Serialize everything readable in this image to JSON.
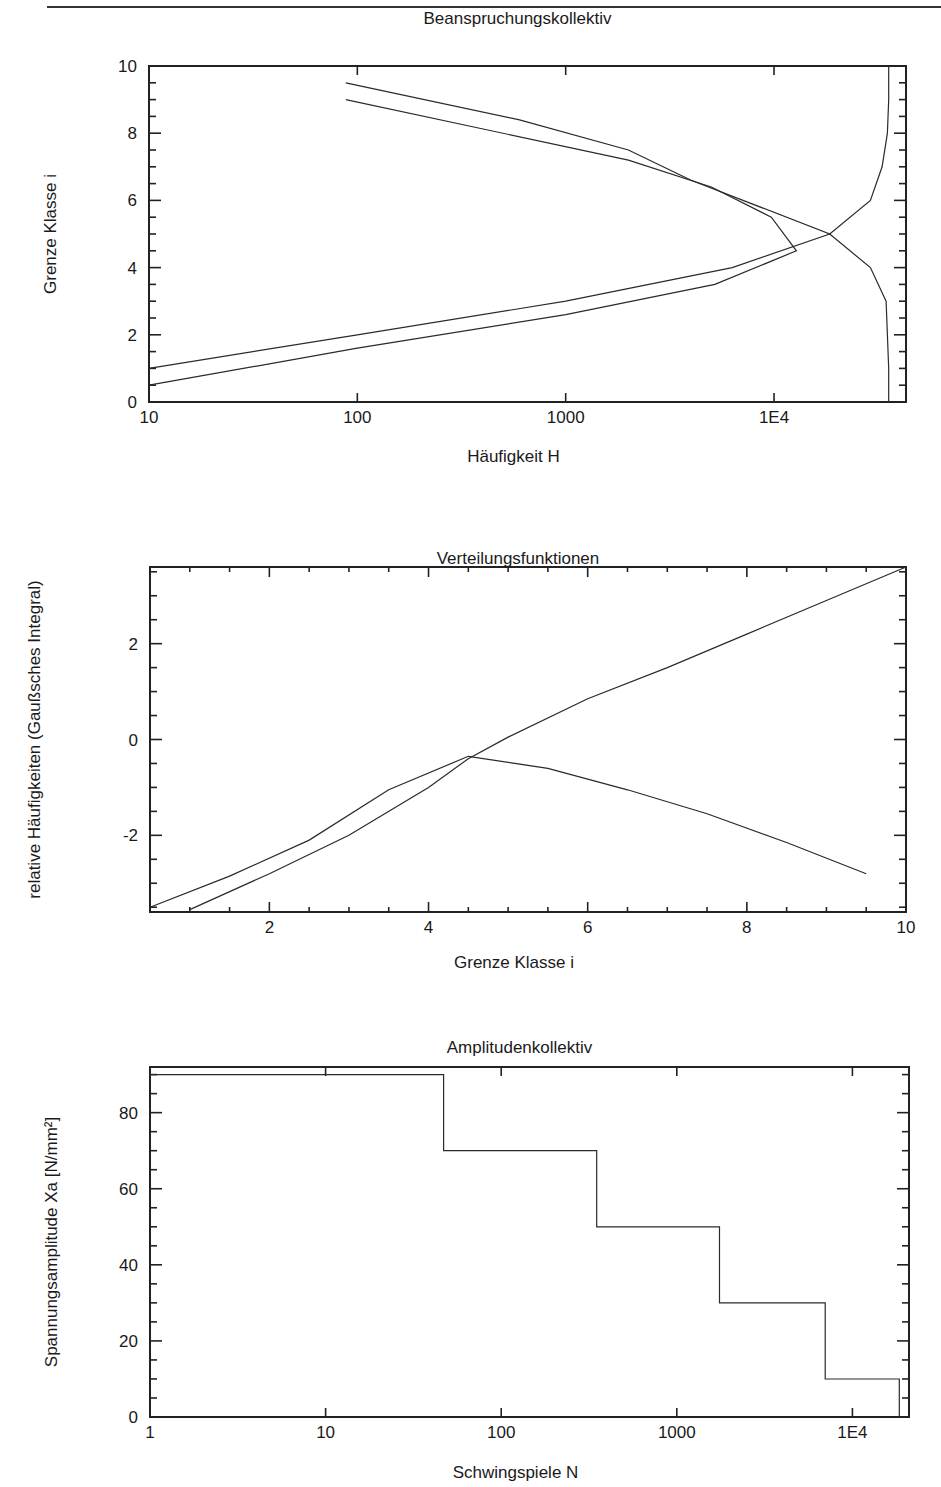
{
  "page": {
    "header_text": "... p ... g ..."
  },
  "chart_data": [
    {
      "id": "beanspruchung",
      "type": "line",
      "title": "Beanspruchungskollektiv",
      "xlabel": "Häufigkeit H",
      "ylabel": "Grenze Klasse i",
      "xscale": "log",
      "xlim": [
        10,
        43000
      ],
      "ylim": [
        0,
        10
      ],
      "xticks": [
        10,
        100,
        1000,
        10000
      ],
      "xtick_labels": [
        "10",
        "100",
        "1000",
        "1E4"
      ],
      "yticks": [
        0,
        2,
        4,
        6,
        8,
        10
      ],
      "ytick_labels": [
        "0",
        "2",
        "4",
        "6",
        "8",
        "10"
      ],
      "grid": false,
      "legend": null,
      "series": [
        {
          "name": "Kollektiv (Klassengrenzen)",
          "x": [
            10,
            100,
            1000,
            6300,
            18500,
            4000,
            2000,
            600,
            88
          ],
          "y": [
            1.0,
            2.0,
            3.0,
            4.0,
            5.0,
            6.6,
            7.5,
            8.4,
            9.5
          ]
        },
        {
          "name": "Kollektiv (Klassenmitten)",
          "x": [
            10,
            100,
            1000,
            5200,
            12800,
            9700,
            5000,
            2000,
            88
          ],
          "y": [
            0.5,
            1.6,
            2.6,
            3.5,
            4.5,
            5.5,
            6.4,
            7.2,
            9.0
          ]
        },
        {
          "name": "Summenhäufigkeit",
          "x": [
            35500,
            35500,
            34500,
            29000,
            18500,
            29000,
            33000,
            35000,
            35500,
            35500
          ],
          "y": [
            0,
            1,
            3.0,
            4.0,
            5.0,
            6.0,
            7.0,
            8.0,
            9.0,
            10.0
          ]
        }
      ]
    },
    {
      "id": "verteilung",
      "type": "line",
      "title": "Verteilungsfunktionen",
      "xlabel": "Grenze Klasse i",
      "ylabel": "relative Häufigkeiten (Gaußsches Integral)",
      "xscale": "linear",
      "xlim": [
        0.5,
        10
      ],
      "ylim": [
        -3.6,
        3.6
      ],
      "xticks": [
        2,
        4,
        6,
        8,
        10
      ],
      "xtick_labels": [
        "2",
        "4",
        "6",
        "8",
        "10"
      ],
      "yticks": [
        -2,
        0,
        2
      ],
      "ytick_labels": [
        "-2",
        "0",
        "2"
      ],
      "grid": false,
      "legend": null,
      "series": [
        {
          "name": "Verteilung A",
          "x": [
            0.5,
            1.5,
            2.5,
            3.5,
            4.5,
            5.5,
            6.5,
            7.5,
            8.5,
            9.5
          ],
          "y": [
            -3.5,
            -2.85,
            -2.1,
            -1.05,
            -0.35,
            -0.6,
            -1.05,
            -1.55,
            -2.15,
            -2.8
          ]
        },
        {
          "name": "Verteilung B",
          "x": [
            1,
            2,
            3,
            4,
            4.5,
            5,
            6,
            7,
            8,
            9,
            10
          ],
          "y": [
            -3.55,
            -2.8,
            -2.0,
            -1.0,
            -0.4,
            0.05,
            0.85,
            1.5,
            2.2,
            2.9,
            3.6
          ]
        }
      ]
    },
    {
      "id": "amplitude",
      "type": "line",
      "title": "Amplitudenkollektiv",
      "xlabel": "Schwingspiele N",
      "ylabel": "Spannungsamplitude Xa [N/mm²]",
      "xscale": "log",
      "xlim": [
        1,
        21000
      ],
      "ylim": [
        0,
        92
      ],
      "xticks": [
        1,
        10,
        100,
        1000,
        10000
      ],
      "xtick_labels": [
        "1",
        "10",
        "100",
        "1000",
        "1E4"
      ],
      "yticks": [
        0,
        20,
        40,
        60,
        80
      ],
      "ytick_labels": [
        "0",
        "20",
        "40",
        "60",
        "80"
      ],
      "grid": false,
      "legend": null,
      "series": [
        {
          "name": "Amplitudenkollektiv (Treppe)",
          "step": true,
          "x": [
            1,
            47,
            47,
            350,
            350,
            1750,
            1750,
            7000,
            7000,
            18500,
            18500
          ],
          "y": [
            90,
            90,
            70,
            70,
            50,
            50,
            30,
            30,
            10,
            10,
            0
          ]
        }
      ]
    }
  ],
  "layout": {
    "charts": [
      {
        "svg_top": 0,
        "svg_height": 480,
        "plot": {
          "left": 149,
          "top": 66,
          "right": 906,
          "bottom": 402
        },
        "title_y": 24,
        "xlabel_y": 462,
        "ylabel_x": 56
      },
      {
        "svg_top": 540,
        "svg_height": 440,
        "plot": {
          "left": 150,
          "top": 567,
          "right": 906,
          "bottom": 912
        },
        "title_y": 24,
        "xlabel_y": 428,
        "ylabel_x": 40
      },
      {
        "svg_top": 1000,
        "svg_height": 487,
        "plot": {
          "left": 150,
          "top": 1067,
          "right": 909,
          "bottom": 1417
        },
        "title_y": 53,
        "xlabel_y": 478,
        "ylabel_x": 57
      }
    ]
  }
}
